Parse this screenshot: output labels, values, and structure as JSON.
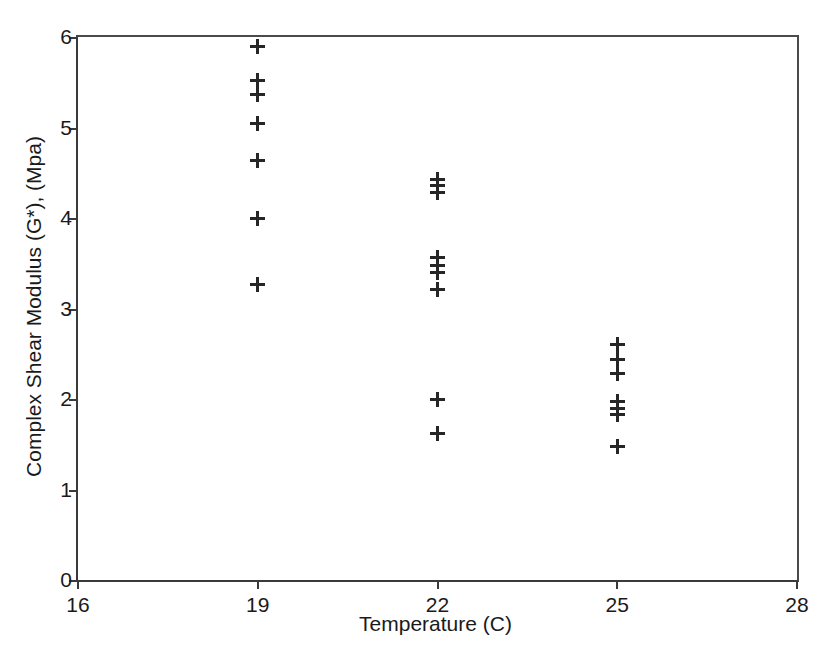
{
  "chart_data": {
    "type": "scatter",
    "title": "",
    "xlabel": "Temperature (C)",
    "ylabel": "Complex Shear Modulus (G*), (Mpa)",
    "xlim": [
      16,
      28
    ],
    "ylim": [
      0,
      6
    ],
    "xticks": [
      "16",
      "19",
      "22",
      "25",
      "28"
    ],
    "xtick_values": [
      16,
      19,
      22,
      25,
      28
    ],
    "yticks": [
      "0",
      "1",
      "2",
      "3",
      "4",
      "5",
      "6"
    ],
    "ytick_values": [
      0,
      1,
      2,
      3,
      4,
      5,
      6
    ],
    "grid": false,
    "legend": false,
    "marker": "plus",
    "marker_color": "#262626",
    "axis_color": "#3a3a3a",
    "background": "#ffffff",
    "series": [
      {
        "name": "Complex Shear Modulus",
        "points": [
          {
            "x": 19,
            "y": 5.9
          },
          {
            "x": 19,
            "y": 5.52
          },
          {
            "x": 19,
            "y": 5.37
          },
          {
            "x": 19,
            "y": 5.04
          },
          {
            "x": 19,
            "y": 4.64
          },
          {
            "x": 19,
            "y": 4.0
          },
          {
            "x": 19,
            "y": 3.26
          },
          {
            "x": 22,
            "y": 4.43
          },
          {
            "x": 22,
            "y": 4.36
          },
          {
            "x": 22,
            "y": 4.28
          },
          {
            "x": 22,
            "y": 3.56
          },
          {
            "x": 22,
            "y": 3.47
          },
          {
            "x": 22,
            "y": 3.4
          },
          {
            "x": 22,
            "y": 3.21
          },
          {
            "x": 22,
            "y": 2.0
          },
          {
            "x": 22,
            "y": 1.62
          },
          {
            "x": 25,
            "y": 2.6
          },
          {
            "x": 25,
            "y": 2.44
          },
          {
            "x": 25,
            "y": 2.28
          },
          {
            "x": 25,
            "y": 1.97
          },
          {
            "x": 25,
            "y": 1.9
          },
          {
            "x": 25,
            "y": 1.83
          },
          {
            "x": 25,
            "y": 1.48
          }
        ]
      }
    ]
  }
}
